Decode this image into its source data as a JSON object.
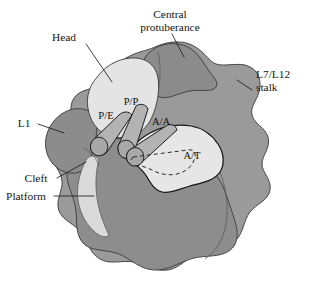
{
  "figure": {
    "background_color": "#ffffff"
  },
  "palette": {
    "large_subunit": "#9a9a9a",
    "large_subunit_dark": "#8a8a8a",
    "body_lower": "#8d8d8d",
    "central_protuberance": "#8b8b8b",
    "l1_region": "#8c8c8c",
    "head": "#e4e4e4",
    "platform": "#dadada",
    "a_site_pocket": "#e6e6e6",
    "trna_fill": "#b3b3b3",
    "outline": "#3a3a3a",
    "outline_dark": "#151515",
    "text": "#151515"
  },
  "labels": {
    "head": "Head",
    "central_protuberance_line1": "Central",
    "central_protuberance_line2": "protuberance",
    "stalk_line1": "L7/L12",
    "stalk_line2": "stalk",
    "l1": "L1",
    "cleft": "Cleft",
    "platform": "Platform",
    "p_e": "P/E",
    "p_p": "P/P",
    "a_a": "A/A",
    "a_t": "A/T"
  },
  "regions": [
    {
      "name": "head",
      "label": "Head",
      "shade": "light"
    },
    {
      "name": "central-protuberance",
      "label": "Central protuberance",
      "shade": "dark"
    },
    {
      "name": "l7-l12-stalk",
      "label": "L7/L12 stalk",
      "shade": "medium"
    },
    {
      "name": "l1-protuberance",
      "label": "L1",
      "shade": "dark"
    },
    {
      "name": "cleft",
      "label": "Cleft",
      "shade": "boundary"
    },
    {
      "name": "platform",
      "label": "Platform",
      "shade": "light"
    },
    {
      "name": "a-site-pocket",
      "label": "A/T",
      "shade": "light"
    }
  ],
  "trna_states": [
    {
      "name": "p-e-trna",
      "label": "P/E"
    },
    {
      "name": "p-p-trna",
      "label": "P/P"
    },
    {
      "name": "a-a-trna",
      "label": "A/A"
    },
    {
      "name": "a-t-trna",
      "label": "A/T",
      "style": "dashed"
    }
  ]
}
